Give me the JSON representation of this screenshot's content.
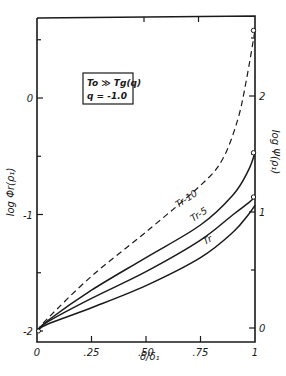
{
  "chart_data": {
    "type": "line",
    "title": "",
    "xlabel": "δ/δ₁",
    "ylabel_left": "log Φr(ρ₁)",
    "ylabel_right": "log Ψ(ρ₁)",
    "xlim": [
      0,
      1
    ],
    "ylim_left": [
      -2.1,
      0.7
    ],
    "ylim_right": [
      -0.1,
      2.7
    ],
    "x_ticks": [
      0,
      0.25,
      0.5,
      0.75,
      1
    ],
    "x_tick_labels": [
      "0",
      ".25",
      ".50",
      ".75",
      "1"
    ],
    "y_left_ticks": [
      0,
      -1,
      -2
    ],
    "y_left_tick_labels": [
      "0",
      "-1",
      "-2"
    ],
    "y_left_minor_ticks": [
      0.5,
      -0.5,
      -1.5
    ],
    "y_right_ticks": [
      2,
      1,
      0
    ],
    "y_right_tick_labels": [
      "2",
      "1",
      "0"
    ],
    "y_right_minor_ticks": [
      2.5,
      1.5,
      0.5
    ],
    "grid": false,
    "legend_box": {
      "line1": "To ≫ Tg(q)",
      "line2": "q = -1.0"
    },
    "series": [
      {
        "name": "dashed",
        "label": "",
        "style": "dashed",
        "x": [
          0,
          0.05,
          0.25,
          0.5,
          0.75,
          0.85,
          0.92,
          0.96,
          1.0
        ],
        "y": [
          -2.0,
          -1.89,
          -1.53,
          -1.15,
          -0.75,
          -0.53,
          -0.19,
          0.15,
          0.58
        ],
        "endpoint_marker": true
      },
      {
        "name": "Tr-10",
        "label": "Tr-10",
        "style": "solid",
        "x": [
          0,
          0.05,
          0.25,
          0.5,
          0.75,
          0.9,
          0.97,
          1.0
        ],
        "y": [
          -2.0,
          -1.91,
          -1.65,
          -1.37,
          -1.09,
          -0.83,
          -0.62,
          -0.47
        ],
        "endpoint_marker": true
      },
      {
        "name": "Tr-5",
        "label": "Tr-5",
        "style": "solid",
        "x": [
          0,
          0.05,
          0.25,
          0.5,
          0.75,
          0.9,
          0.97,
          1.0
        ],
        "y": [
          -2.0,
          -1.92,
          -1.72,
          -1.49,
          -1.22,
          -1.0,
          -0.9,
          -0.85
        ],
        "endpoint_marker": true
      },
      {
        "name": "Tr",
        "label": "Tr",
        "style": "solid",
        "x": [
          0,
          0.05,
          0.25,
          0.5,
          0.75,
          0.9,
          0.97,
          1.0
        ],
        "y": [
          -2.0,
          -1.94,
          -1.8,
          -1.61,
          -1.37,
          -1.15,
          -1.0,
          -0.92
        ],
        "endpoint_marker": false
      }
    ]
  }
}
